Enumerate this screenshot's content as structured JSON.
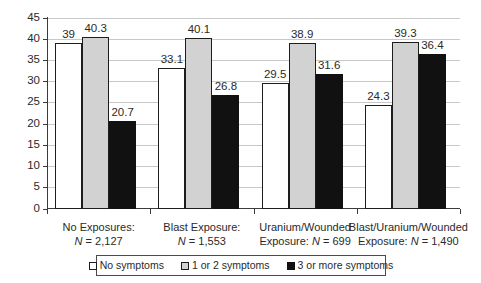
{
  "chart_data": {
    "type": "bar",
    "title": "",
    "subtitle": "",
    "xlabel": "",
    "ylabel": "",
    "ylim": [
      0,
      45
    ],
    "ytick_step": 5,
    "yticks": [
      "0",
      "5",
      "10",
      "15",
      "20",
      "25",
      "30",
      "35",
      "40",
      "45"
    ],
    "grid": true,
    "legend_position": "bottom",
    "categories": [
      "No Exposures: N = 2,127",
      "Blast Exposure: N = 1,553",
      "Uranium/Wounded Exposure: N = 699",
      "Blast/Uranium/Wounded Exposure: N = 1,490"
    ],
    "category_lines": [
      {
        "line1": "No Exposures:",
        "line2_pre": "",
        "line2_n": "N",
        "line2_post": " = 2,127"
      },
      {
        "line1": "Blast Exposure:",
        "line2_pre": "",
        "line2_n": "N",
        "line2_post": " = 1,553"
      },
      {
        "line1": "Uranium/Wounded",
        "line2_pre": "Exposure: ",
        "line2_n": "N",
        "line2_post": " = 699"
      },
      {
        "line1": "Blast/Uranium/Wounded",
        "line2_pre": "Exposure: ",
        "line2_n": "N",
        "line2_post": " = 1,490"
      }
    ],
    "series": [
      {
        "name": "No symptoms",
        "color": "#ffffff",
        "values": [
          39,
          33.1,
          29.5,
          24.3
        ],
        "labels": [
          "39",
          "33.1",
          "29.5",
          "24.3"
        ]
      },
      {
        "name": "1 or 2 symptoms",
        "color": "#d2d2d2",
        "values": [
          40.3,
          40.1,
          38.9,
          39.3
        ],
        "labels": [
          "40.3",
          "40.1",
          "38.9",
          "39.3"
        ]
      },
      {
        "name": "3 or more symptoms",
        "color": "#111111",
        "values": [
          20.7,
          26.8,
          31.6,
          36.4
        ],
        "labels": [
          "20.7",
          "26.8",
          "31.6",
          "36.4"
        ]
      }
    ]
  },
  "legend": {
    "items": [
      {
        "label": "No symptoms",
        "swatch": "white-square-marker"
      },
      {
        "label": "1 or 2 symptoms",
        "swatch": "gray-square-marker"
      },
      {
        "label": "3 or more symptoms",
        "swatch": "black-square-marker"
      }
    ]
  }
}
